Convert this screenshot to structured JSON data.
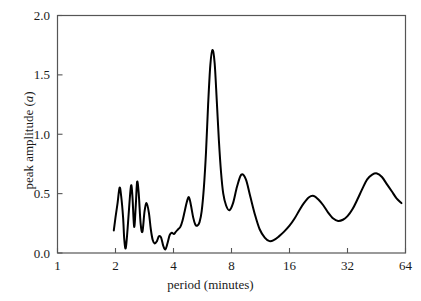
{
  "chart_data": {
    "type": "line",
    "title": "",
    "subtitle": "",
    "xlabel_text": "period (minutes)",
    "ylabel_prefix": "peak amplitude (",
    "ylabel_symbol": "a",
    "ylabel_suffix": ")",
    "xlabel": "period (minutes)",
    "ylabel": "peak amplitude (a)",
    "x_scale": "log2",
    "xlim": [
      1,
      64
    ],
    "ylim": [
      0.0,
      2.0
    ],
    "xticks": [
      1,
      2,
      4,
      8,
      16,
      32,
      64
    ],
    "xtick_labels": [
      "1",
      "2",
      "4",
      "8",
      "16",
      "32",
      "64"
    ],
    "yticks": [
      0.0,
      0.5,
      1.0,
      1.5,
      2.0
    ],
    "ytick_labels": [
      "0.0",
      "0.5",
      "1.0",
      "1.5",
      "2.0"
    ],
    "grid": false,
    "legend": false,
    "legend_position": "none",
    "line_color": "#000000",
    "line_width": 2.0,
    "frame_color": "#555555",
    "background_color": "#ffffff",
    "series": [
      {
        "name": "peak amplitude",
        "x": [
          1.96,
          2.0,
          2.05,
          2.1,
          2.14,
          2.19,
          2.22,
          2.26,
          2.31,
          2.36,
          2.41,
          2.45,
          2.5,
          2.55,
          2.59,
          2.64,
          2.7,
          2.76,
          2.83,
          2.9,
          2.98,
          3.05,
          3.12,
          3.2,
          3.28,
          3.36,
          3.45,
          3.54,
          3.63,
          3.72,
          3.82,
          3.92,
          4.02,
          4.12,
          4.23,
          4.34,
          4.45,
          4.57,
          4.69,
          4.81,
          4.93,
          5.06,
          5.19,
          5.32,
          5.46,
          5.6,
          5.75,
          5.9,
          6.05,
          6.21,
          6.37,
          6.54,
          6.71,
          6.88,
          7.06,
          7.25,
          7.5,
          7.8,
          8.15,
          8.55,
          9.0,
          9.5,
          10.0,
          10.6,
          11.2,
          11.9,
          12.6,
          13.3,
          14.1,
          15.0,
          16.0,
          17.0,
          18.0,
          19.0,
          20.2,
          21.4,
          22.6,
          24.0,
          25.4,
          27.0,
          28.6,
          30.3,
          32.0,
          34.0,
          36.0,
          38.2,
          40.5,
          43.0,
          45.5,
          48.3,
          51.2,
          54.3,
          57.5,
          61.0
        ],
        "y": [
          0.19,
          0.3,
          0.42,
          0.55,
          0.48,
          0.3,
          0.12,
          0.04,
          0.2,
          0.41,
          0.57,
          0.47,
          0.22,
          0.41,
          0.6,
          0.5,
          0.25,
          0.18,
          0.35,
          0.42,
          0.34,
          0.2,
          0.11,
          0.08,
          0.1,
          0.14,
          0.13,
          0.06,
          0.03,
          0.08,
          0.15,
          0.17,
          0.16,
          0.18,
          0.2,
          0.22,
          0.27,
          0.35,
          0.43,
          0.47,
          0.4,
          0.3,
          0.24,
          0.23,
          0.26,
          0.35,
          0.55,
          0.85,
          1.25,
          1.58,
          1.71,
          1.6,
          1.28,
          0.95,
          0.68,
          0.5,
          0.4,
          0.36,
          0.42,
          0.56,
          0.66,
          0.62,
          0.48,
          0.32,
          0.2,
          0.13,
          0.1,
          0.11,
          0.14,
          0.18,
          0.23,
          0.29,
          0.36,
          0.42,
          0.47,
          0.48,
          0.45,
          0.4,
          0.34,
          0.29,
          0.27,
          0.28,
          0.31,
          0.37,
          0.45,
          0.54,
          0.62,
          0.66,
          0.67,
          0.64,
          0.58,
          0.52,
          0.46,
          0.42
        ]
      }
    ],
    "annotations": [],
    "data_points_note": "single smooth spectral curve, peak maximum 1.71 near period 5.2 minutes"
  },
  "axes": {
    "x_tick_labels": [
      "1",
      "2",
      "4",
      "8",
      "16",
      "32",
      "64"
    ],
    "y_tick_labels": [
      "0.0",
      "0.5",
      "1.0",
      "1.5",
      "2.0"
    ]
  }
}
